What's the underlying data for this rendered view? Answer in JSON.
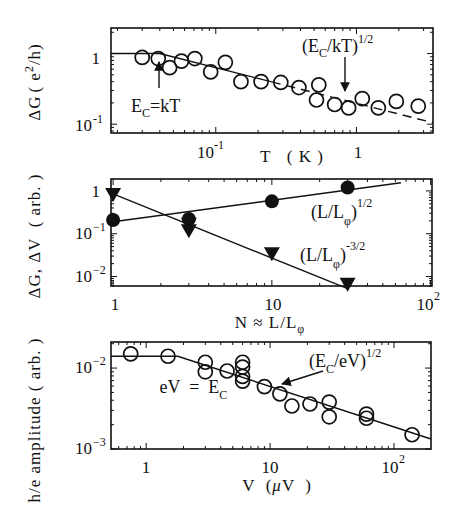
{
  "chart_data": [
    {
      "id": "panel_a",
      "type": "scatter",
      "xscale": "log",
      "yscale": "log",
      "xlabel": "T  ( K )",
      "ylabel": "ΔG (e²/h)",
      "xlim": [
        0.018,
        3.5
      ],
      "ylim": [
        0.075,
        2.3
      ],
      "xticks": [
        {
          "value": 0.1,
          "label": "10⁻¹"
        },
        {
          "value": 1,
          "label": "1"
        }
      ],
      "yticks": [
        {
          "value": 1,
          "label": "1"
        },
        {
          "value": 0.1,
          "label": "10⁻¹"
        }
      ],
      "grid": false,
      "series": [
        {
          "name": "data",
          "marker": "open-circle",
          "x": [
            0.03,
            0.039,
            0.047,
            0.057,
            0.071,
            0.092,
            0.117,
            0.151,
            0.21,
            0.29,
            0.39,
            0.54,
            0.52,
            0.7,
            0.88,
            1.1,
            1.43,
            1.92,
            2.75
          ],
          "y": [
            0.88,
            0.85,
            0.63,
            0.78,
            0.85,
            0.55,
            0.75,
            0.4,
            0.4,
            0.39,
            0.33,
            0.36,
            0.22,
            0.19,
            0.17,
            0.23,
            0.17,
            0.21,
            0.18
          ]
        },
        {
          "name": "fit-solid",
          "style": "solid line",
          "x": [
            0.018,
            0.04,
            3.5
          ],
          "y": [
            1.0,
            1.0,
            0.105
          ]
        }
      ],
      "annotations": [
        {
          "text": "E_C=kT",
          "arrow_to": {
            "x": 0.039,
            "y": 0.85
          }
        },
        {
          "text": "(E_C/kT)^1/2",
          "arrow_to": {
            "x": 0.8,
            "y": 0.21
          }
        }
      ]
    },
    {
      "id": "panel_b",
      "type": "scatter",
      "xscale": "log",
      "yscale": "log",
      "xlabel": "N ≈ L/L_φ",
      "ylabel": "ΔG, ΔV  ( arb. )",
      "xlim": [
        0.97,
        102
      ],
      "ylim": [
        0.006,
        1.9
      ],
      "xticks": [
        {
          "value": 1,
          "label": "1"
        },
        {
          "value": 10,
          "label": "10"
        },
        {
          "value": 100,
          "label": "10²"
        }
      ],
      "yticks": [
        {
          "value": 1,
          "label": "1"
        },
        {
          "value": 0.1,
          "label": "10⁻¹"
        },
        {
          "value": 0.01,
          "label": "10⁻²"
        }
      ],
      "grid": false,
      "series": [
        {
          "name": "(L/L_φ)^1/2",
          "marker": "filled-circle",
          "x": [
            1,
            3,
            10,
            30
          ],
          "y": [
            0.21,
            0.22,
            0.57,
            1.2
          ],
          "fit": {
            "slope": 0.5,
            "x": [
              1,
              65
            ],
            "y": [
              0.19,
              1.55
            ]
          }
        },
        {
          "name": "(L/L_φ)^-3/2",
          "marker": "filled-triangle-down",
          "x": [
            1,
            3,
            3,
            10,
            30
          ],
          "y": [
            0.85,
            0.17,
            0.12,
            0.035,
            0.0068
          ],
          "fit": {
            "slope": -1.5,
            "x": [
              1,
              30
            ],
            "y": [
              0.85,
              0.0052
            ]
          }
        }
      ],
      "annotations": [
        {
          "text": "(L/L_φ)^1/2"
        },
        {
          "text": "(L/L_φ)^-3/2"
        }
      ]
    },
    {
      "id": "panel_c",
      "type": "scatter",
      "xscale": "log",
      "yscale": "log",
      "xlabel": "V  (μV  )",
      "ylabel": "h/e amplitude ( arb. )",
      "xlim": [
        0.52,
        199
      ],
      "ylim": [
        0.001,
        0.021
      ],
      "xticks": [
        {
          "value": 1,
          "label": "1"
        },
        {
          "value": 10,
          "label": "10"
        },
        {
          "value": 100,
          "label": "10²"
        }
      ],
      "yticks": [
        {
          "value": 0.01,
          "label": "10⁻²"
        },
        {
          "value": 0.001,
          "label": "10⁻³"
        }
      ],
      "grid": false,
      "series": [
        {
          "name": "data",
          "marker": "open-circle",
          "x": [
            0.75,
            1.5,
            3.0,
            3.0,
            4.5,
            6.0,
            6.0,
            6.0,
            6.0,
            9.0,
            12,
            15,
            21,
            30,
            30,
            60,
            60,
            140
          ],
          "y": [
            0.015,
            0.014,
            0.0118,
            0.009,
            0.0092,
            0.0118,
            0.0103,
            0.0079,
            0.0069,
            0.0059,
            0.0048,
            0.0034,
            0.0036,
            0.0038,
            0.0025,
            0.0027,
            0.0024,
            0.0015
          ]
        },
        {
          "name": "fit",
          "style": "solid line",
          "x": [
            0.52,
            1.8,
            199
          ],
          "y": [
            0.014,
            0.014,
            0.00133
          ]
        }
      ],
      "annotations": [
        {
          "text": "eV  =  E_C"
        },
        {
          "text": "(E_C/eV)^1/2",
          "arrow_to": {
            "x": 12,
            "y": 0.0049
          }
        }
      ]
    }
  ],
  "labels": {
    "a": {
      "ylabel_main": "ΔG",
      "ylabel_rest": "( e",
      "ylabel_sup": "2",
      "ylabel_end": "/h)",
      "ytick_1": "1",
      "ytick_2_base": "10",
      "ytick_2_exp": "-1",
      "xtick_1_base": "10",
      "xtick_1_exp": "-1",
      "xtick_2": "1",
      "xlabel": "T   ( K )",
      "ann1_a": "E",
      "ann1_sub": "C",
      "ann1_b": "=kT",
      "ann2_a": "(E",
      "ann2_sub": "C",
      "ann2_b": "/kT)",
      "ann2_sup": "1/2"
    },
    "b": {
      "ylabel": "ΔG, ΔV  ( arb. )",
      "ytick_1": "1",
      "ytick_2_base": "10",
      "ytick_2_exp": "−1",
      "ytick_3_base": "10",
      "ytick_3_exp": "−2",
      "xtick_1": "1",
      "xtick_2": "10",
      "xtick_3_base": "10",
      "xtick_3_exp": "2",
      "xlabel_main": "N ≈ L/L",
      "xlabel_sub": "φ",
      "ann1_a": "(L/L",
      "ann1_sub": "φ",
      "ann1_b": ")",
      "ann1_sup": "1/2",
      "ann2_a": "(L/L",
      "ann2_sub": "φ",
      "ann2_b": ")",
      "ann2_sup": "-3/2"
    },
    "c": {
      "ylabel": "h/e amplitude ( arb. )",
      "ytick_1_base": "10",
      "ytick_1_exp": "−2",
      "ytick_2_base": "10",
      "ytick_2_exp": "−3",
      "xtick_1": "1",
      "xtick_2": "10",
      "xtick_3_base": "10",
      "xtick_3_exp": "2",
      "xlabel_main": "V  (",
      "xlabel_mu": "μ",
      "xlabel_end": "V  )",
      "ann1_a": "eV  =  E",
      "ann1_sub": "C",
      "ann2_a": "(E",
      "ann2_sub": "C",
      "ann2_b": "/eV)",
      "ann2_sup": "1/2"
    }
  }
}
